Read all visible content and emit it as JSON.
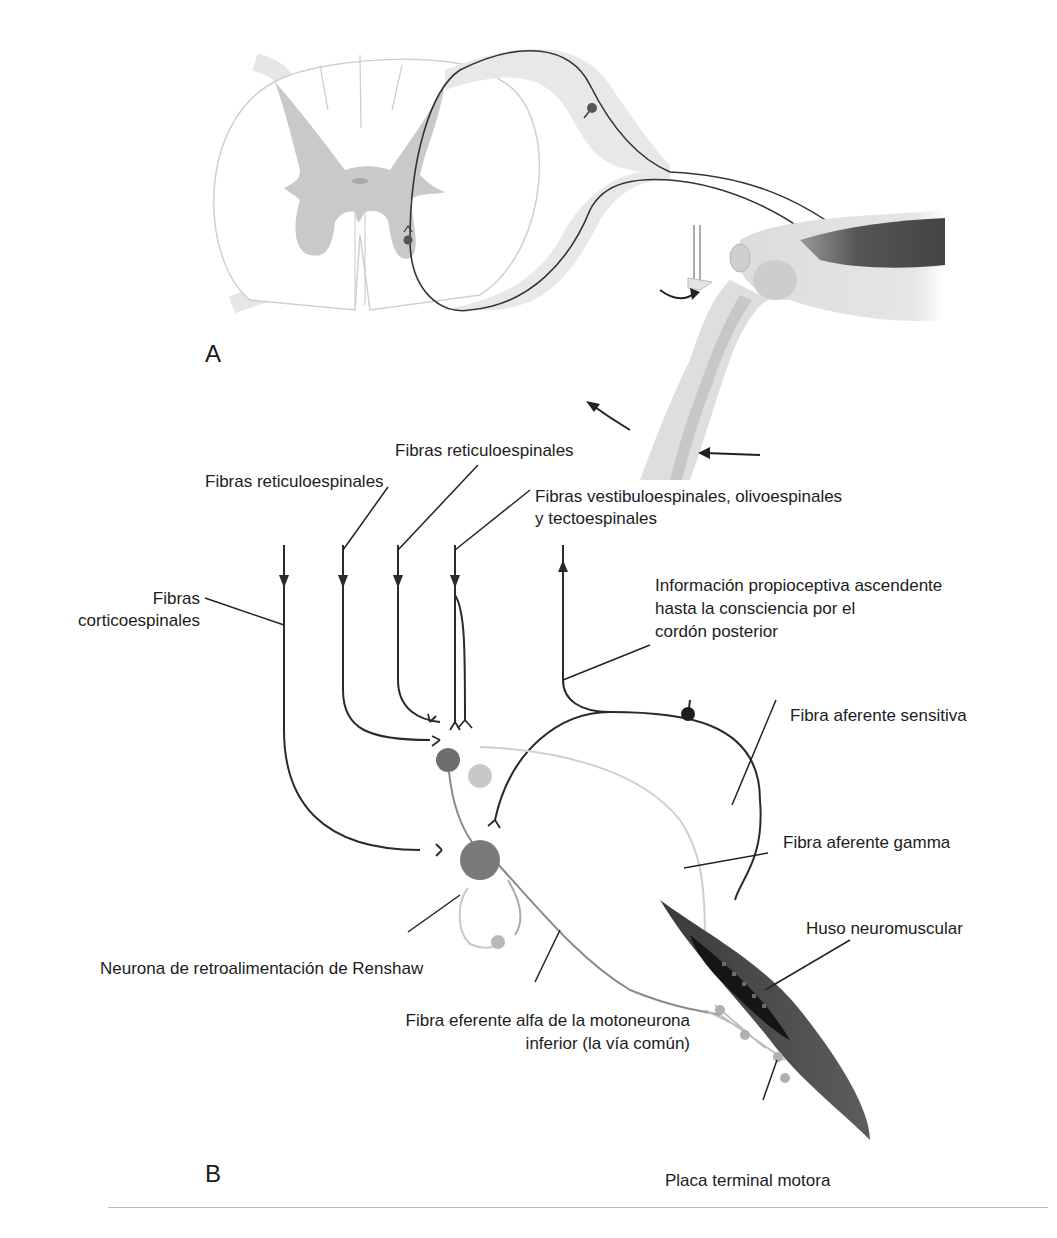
{
  "panels": {
    "a": "A",
    "b": "B"
  },
  "labels": {
    "reticulo_1": "Fibras reticuloespinales",
    "reticulo_2": "Fibras reticuloespinales",
    "vestibulo_line1": "Fibras vestibuloespinales, olivoespinales",
    "vestibulo_line2": "y tectoespinales",
    "cortico_line1": "Fibras",
    "cortico_line2": "corticoespinales",
    "propio_line1": "Información propioceptiva ascendente",
    "propio_line2": "hasta la consciencia por el",
    "propio_line3": "cordón posterior",
    "aferente_sensitiva": "Fibra aferente sensitiva",
    "aferente_gamma": "Fibra aferente gamma",
    "huso": "Huso neuromuscular",
    "renshaw": "Neurona de retroalimentación de Renshaw",
    "eferente_line1": "Fibra eferente alfa de la motoneurona",
    "eferente_line2": "inferior (la vía común)",
    "placa": "Placa terminal motora"
  },
  "colors": {
    "gray_matter": "#c9c9c9",
    "nerve_sheath": "#e6e6e6",
    "fiber_dark": "#2a2a2a",
    "neuron_dark": "#6e6e6e",
    "neuron_light": "#c8c8c8",
    "muscle": "#4a4a4a"
  }
}
